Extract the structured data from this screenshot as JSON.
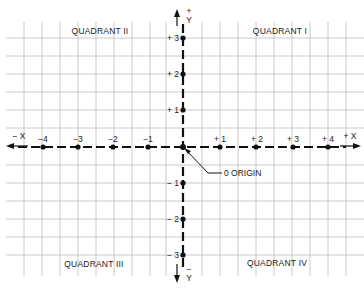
{
  "diagram": {
    "type": "cartesian-coordinate-plane",
    "quadrants": [
      {
        "id": "I",
        "label": "QUADRANT I"
      },
      {
        "id": "II",
        "label": "QUADRANT II"
      },
      {
        "id": "III",
        "label": "QUADRANT III"
      },
      {
        "id": "IV",
        "label": "QUADRANT IV"
      }
    ],
    "x_axis": {
      "positive_label": "+ X",
      "negative_label": "− X",
      "ticks": [
        "−4",
        "−3",
        "−2",
        "−1",
        "+ 1",
        "+ 2",
        "+ 3",
        "+ 4"
      ]
    },
    "y_axis": {
      "positive_label_sign": "+",
      "positive_label": "Y",
      "negative_label_sign": "−",
      "negative_label": "Y",
      "ticks": [
        "+ 3",
        "+ 2",
        "+ 1",
        "− 1",
        "− 2",
        "− 3"
      ]
    },
    "origin_label": "0 ORIGIN",
    "colors": {
      "grid": "#bdbdbd",
      "axis": "#111111",
      "text": "#222222",
      "background": "#ffffff"
    }
  }
}
